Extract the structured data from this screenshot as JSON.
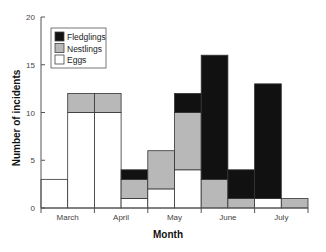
{
  "chart_data": {
    "type": "bar",
    "stacked": true,
    "title": "",
    "xlabel": "Month",
    "ylabel": "Number of incidents",
    "ylim": [
      0,
      20
    ],
    "yticks": [
      0,
      5,
      10,
      15,
      20
    ],
    "month_labels": [
      "March",
      "April",
      "May",
      "June",
      "July"
    ],
    "categories": [
      "March (early)",
      "March (late)",
      "April (early)",
      "April (late)",
      "May (early)",
      "May (late)",
      "June (early)",
      "June (late)",
      "July (early)",
      "July (late)"
    ],
    "series": [
      {
        "name": "Eggs",
        "color": "#ffffff",
        "values": [
          3,
          10,
          10,
          1,
          2,
          4,
          0,
          0,
          1,
          0
        ]
      },
      {
        "name": "Nestlings",
        "color": "#b8b8b8",
        "values": [
          0,
          2,
          2,
          2,
          4,
          6,
          3,
          1,
          0,
          1
        ]
      },
      {
        "name": "Fledglings",
        "color": "#111111",
        "values": [
          0,
          0,
          0,
          1,
          0,
          2,
          13,
          3,
          12,
          0
        ]
      }
    ],
    "legend": {
      "position": "upper-left",
      "entries": [
        "Fledglings",
        "Nestlings",
        "Eggs"
      ]
    },
    "grid": false
  }
}
